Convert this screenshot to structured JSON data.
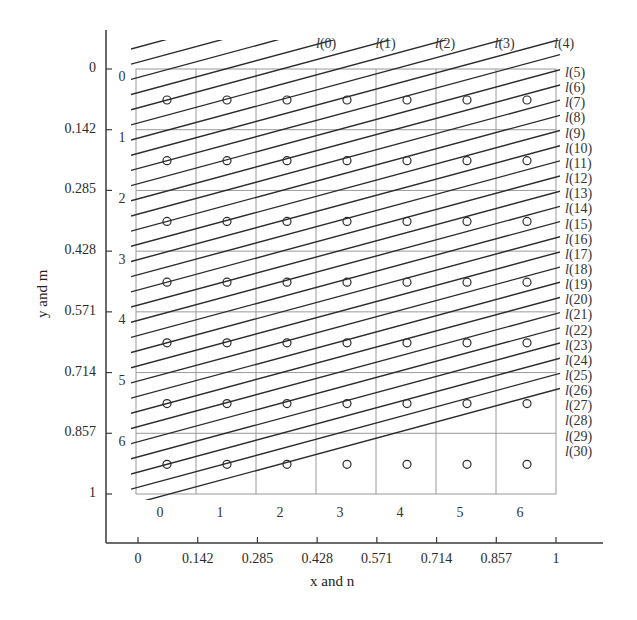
{
  "chart_data": {
    "type": "diagram-lattice",
    "xlabel": "x and n",
    "ylabel": "y and m",
    "x_ticks": [
      "0",
      "0.142",
      "0.285",
      "0.428",
      "0.571",
      "0.714",
      "0.857",
      "1"
    ],
    "y_ticks": [
      "0",
      "0.142",
      "0.285",
      "0.428",
      "0.571",
      "0.714",
      "0.857",
      "1"
    ],
    "column_labels": [
      "0",
      "1",
      "2",
      "3",
      "4",
      "5",
      "6"
    ],
    "row_labels": [
      "0",
      "1",
      "2",
      "3",
      "4",
      "5",
      "6"
    ],
    "grid": {
      "rows": 7,
      "cols": 7,
      "on": true
    },
    "points": "circle at centre of each of the 7x7 cells (49 points)",
    "lines": {
      "count": 31,
      "labels": [
        "l(0)",
        "l(1)",
        "l(2)",
        "l(3)",
        "l(4)",
        "l(5)",
        "l(6)",
        "l(7)",
        "l(8)",
        "l(9)",
        "l(10)",
        "l(11)",
        "l(12)",
        "l(13)",
        "l(14)",
        "l(15)",
        "l(16)",
        "l(17)",
        "l(18)",
        "l(19)",
        "l(20)",
        "l(21)",
        "l(22)",
        "l(23)",
        "l(24)",
        "l(25)",
        "l(26)",
        "l(27)",
        "l(28)",
        "l(29)",
        "l(30)"
      ],
      "top_labels": [
        "l(0)",
        "l(1)",
        "l(2)",
        "l(3)",
        "l(4)"
      ],
      "right_labels": [
        "l(5)",
        "l(6)",
        "l(7)",
        "l(8)",
        "l(9)",
        "l(10)",
        "l(11)",
        "l(12)",
        "l(13)",
        "l(14)",
        "l(15)",
        "l(16)",
        "l(17)",
        "l(18)",
        "l(19)",
        "l(20)",
        "l(21)",
        "l(22)",
        "l(23)",
        "l(24)",
        "l(25)",
        "l(26)",
        "l(27)",
        "l(28)",
        "l(29)",
        "l(30)"
      ],
      "slope": "parallel lines rising left-to-right, 4 lines per row spacing"
    },
    "xlim": [
      0,
      1
    ],
    "ylim": [
      0,
      1
    ],
    "y_inverted": true
  },
  "colors": {
    "grid": "#9a9a9a",
    "lines": "#2b2b2b",
    "axis": "#3a3a3a",
    "text": "#2a2a2a"
  }
}
